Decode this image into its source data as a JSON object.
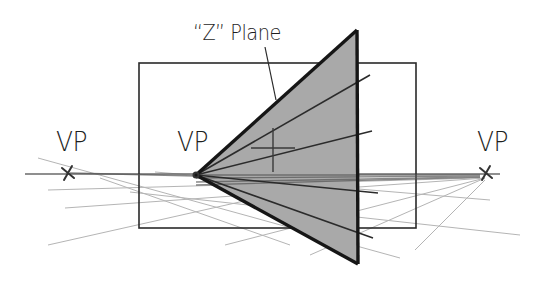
{
  "diagram": {
    "title_label": "“Z” Plane",
    "vp_labels": [
      "VP",
      "VP",
      "VP"
    ],
    "colors": {
      "background": "#ffffff",
      "ink": "#1e1e1e",
      "plane_fill": "#a9a9a9",
      "guide_light": "#9a9a9a",
      "guide_faint": "#c4c4c4"
    },
    "rectangle": {
      "x": 139,
      "y": 63,
      "width": 277,
      "height": 165
    },
    "triangle": {
      "apex": [
        196,
        175
      ],
      "top": [
        357,
        30
      ],
      "bottom": [
        358,
        264
      ]
    },
    "vanishing_points": {
      "left": [
        68,
        173
      ],
      "center": [
        196,
        175
      ],
      "right": [
        486,
        173
      ]
    },
    "horizon_line": {
      "y": 174,
      "x1": 25,
      "x2": 500
    },
    "center_rays": [
      [
        196,
        175,
        370,
        75
      ],
      [
        196,
        175,
        372,
        131
      ],
      [
        196,
        175,
        378,
        193
      ],
      [
        196,
        175,
        373,
        238
      ]
    ],
    "cross_mark": {
      "cx": 273,
      "cy": 148,
      "h_half": 22,
      "v_half": 20
    },
    "leader_line": [
      265,
      47,
      276,
      100
    ],
    "guide_lines_dark": [
      [
        196,
        175,
        480,
        175
      ],
      [
        196,
        178,
        480,
        176
      ],
      [
        196,
        182,
        480,
        177
      ],
      [
        196,
        185,
        480,
        177
      ],
      [
        70,
        173,
        196,
        176
      ]
    ],
    "guide_lines_light": [
      [
        38,
        158,
        400,
        258
      ],
      [
        48,
        190,
        480,
        178
      ],
      [
        65,
        208,
        485,
        178
      ],
      [
        48,
        245,
        360,
        175
      ],
      [
        225,
        245,
        485,
        178
      ],
      [
        310,
        255,
        485,
        178
      ],
      [
        415,
        250,
        485,
        180
      ],
      [
        130,
        192,
        520,
        235
      ],
      [
        155,
        172,
        490,
        200
      ],
      [
        100,
        178,
        290,
        245
      ]
    ],
    "labels": {
      "plane": {
        "x": 193,
        "y": 23
      },
      "vp_left": {
        "x": 56,
        "y": 128
      },
      "vp_center": {
        "x": 177,
        "y": 128
      },
      "vp_right": {
        "x": 477,
        "y": 128
      }
    }
  }
}
